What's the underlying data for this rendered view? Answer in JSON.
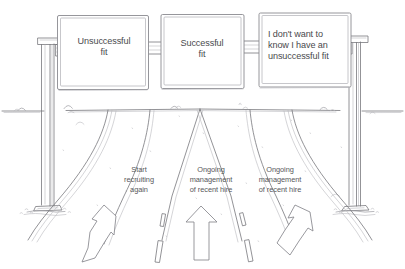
{
  "diagram": {
    "style": "hand-drawn pencil sketch",
    "background_color": "#ffffff",
    "ink_color": "#6b6b70",
    "text_color": "#4a4a4d"
  },
  "gantry": {
    "left_post_name": "left-gantry-post",
    "right_post_name": "right-gantry-post",
    "signs": [
      {
        "id": "sign-unsuccessful-fit",
        "text": "Unsuccessful\nfit",
        "align": "center"
      },
      {
        "id": "sign-successful-fit",
        "text": "Successful\nfit",
        "align": "center"
      },
      {
        "id": "sign-dont-want-to-know",
        "text": "I don't want to\nknow I have an\nunsuccessful fit",
        "align": "left"
      }
    ]
  },
  "road": {
    "lanes": [
      {
        "id": "lane-left",
        "label": "Start\nrecruiting\nagain",
        "arrow": "arrow-up-left"
      },
      {
        "id": "lane-center",
        "label": "Ongoing\nmanagement\nof recent hire",
        "arrow": "arrow-up"
      },
      {
        "id": "lane-right",
        "label": "Ongoing\nmanagement\nof recent hire",
        "arrow": "arrow-up-right"
      }
    ]
  }
}
